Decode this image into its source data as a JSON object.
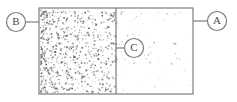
{
  "figure": {
    "type": "two-chamber-container-diagram",
    "background_color": "#ffffff",
    "stroke_color": "#7d7d7d",
    "dot_color": "#555555",
    "container": {
      "x": 39,
      "y": 8,
      "width": 154,
      "height": 86,
      "border_width": 1.2
    },
    "divider": {
      "x": 116,
      "y_top": 8,
      "y_bottom": 94,
      "width": 1.2
    },
    "chambers": [
      {
        "name": "left-chamber",
        "label": "dense-region",
        "x": 40,
        "y": 9,
        "width": 76,
        "height": 84,
        "dot_count": 900,
        "density": "high"
      },
      {
        "name": "right-chamber",
        "label": "sparse-region",
        "x": 117,
        "y": 9,
        "width": 75,
        "height": 84,
        "dot_count": 70,
        "density": "low"
      }
    ],
    "callouts": [
      {
        "id": "callout-b",
        "label": "B",
        "cx": 16,
        "cy": 22,
        "r": 9.5,
        "leader": {
          "x1": 25.5,
          "y1": 22,
          "x2": 39,
          "y2": 22
        }
      },
      {
        "id": "callout-a",
        "label": "A",
        "cx": 217,
        "cy": 21,
        "r": 9.5,
        "leader": {
          "x1": 207.5,
          "y1": 21,
          "x2": 193,
          "y2": 21
        }
      },
      {
        "id": "callout-c",
        "label": "C",
        "cx": 134,
        "cy": 48,
        "r": 9.5,
        "leader": {
          "x1": 124.5,
          "y1": 48,
          "x2": 116,
          "y2": 48
        }
      }
    ]
  }
}
